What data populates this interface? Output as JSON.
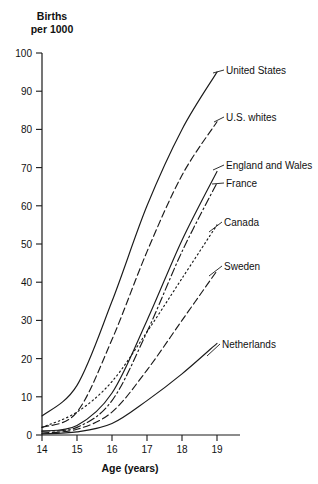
{
  "chart_data": {
    "type": "line",
    "title": "",
    "ylabel": "Births\nper 1000",
    "ylabel_line1": "Births",
    "ylabel_line2": "per 1000",
    "xlabel": "Age (years)",
    "xlim": [
      14,
      19
    ],
    "ylim": [
      0,
      100
    ],
    "grid": false,
    "legend_position": "inline-right-labels",
    "x": [
      14,
      15,
      16,
      17,
      18,
      19
    ],
    "xticks": [
      "14",
      "15",
      "16",
      "17",
      "18",
      "19"
    ],
    "yticks": [
      "0",
      "10",
      "20",
      "30",
      "40",
      "50",
      "60",
      "70",
      "80",
      "90",
      "100"
    ],
    "series": [
      {
        "name": "United States",
        "label": "United States",
        "style": "solid",
        "values": [
          5,
          13,
          35,
          60,
          80,
          95
        ]
      },
      {
        "name": "U.S. whites",
        "label": "U.S. whites",
        "style": "dashed",
        "values": [
          2,
          6,
          25,
          48,
          68,
          82
        ]
      },
      {
        "name": "England and Wales",
        "label": "England and Wales",
        "style": "solid",
        "values": [
          1,
          2.5,
          11,
          30,
          51,
          69
        ]
      },
      {
        "name": "France",
        "label": "France",
        "style": "dash-dot",
        "values": [
          1,
          2,
          9,
          27,
          48,
          66
        ]
      },
      {
        "name": "Canada",
        "label": "Canada",
        "style": "dotted",
        "values": [
          2,
          6,
          14,
          27,
          41,
          55
        ]
      },
      {
        "name": "Sweden",
        "label": "Sweden",
        "style": "dashed",
        "values": [
          0.5,
          1.5,
          6,
          17,
          30,
          43
        ]
      },
      {
        "name": "Netherlands",
        "label": "Netherlands",
        "style": "solid",
        "values": [
          0.3,
          0.8,
          3,
          9,
          16,
          24
        ]
      }
    ]
  }
}
